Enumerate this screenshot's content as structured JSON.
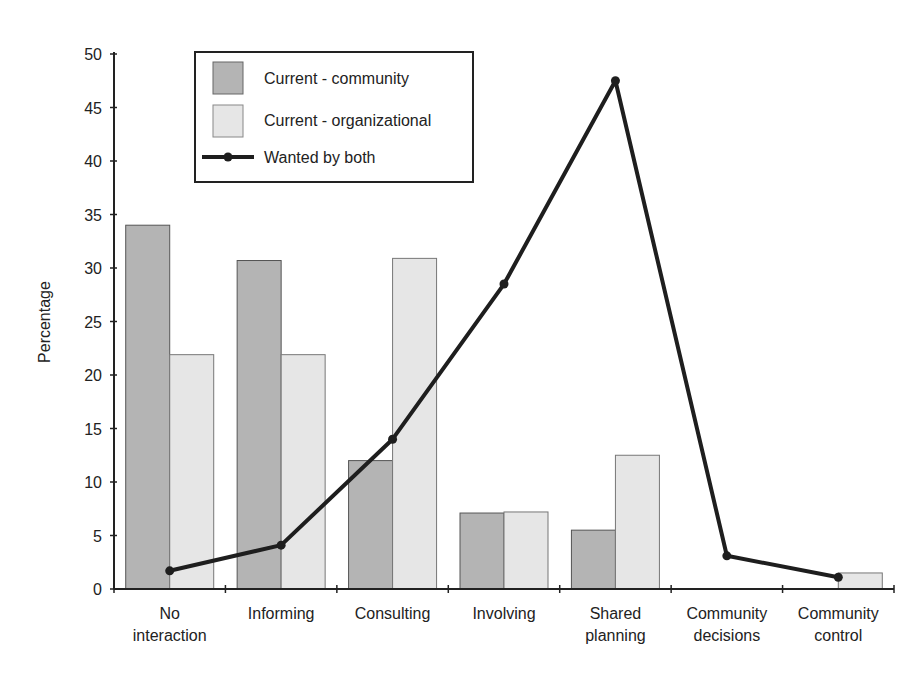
{
  "chart_data": {
    "type": "bar",
    "title": "",
    "xlabel": "",
    "ylabel": "Percentage",
    "ylim": [
      0,
      50
    ],
    "yticks": [
      0,
      5,
      10,
      15,
      20,
      25,
      30,
      35,
      40,
      45,
      50
    ],
    "grid": false,
    "legend_position": "top-left (inside plot)",
    "categories": [
      [
        "No",
        "interaction"
      ],
      [
        "Informing"
      ],
      [
        "Consulting"
      ],
      [
        "Involving"
      ],
      [
        "Shared",
        "planning"
      ],
      [
        "Community",
        "decisions"
      ],
      [
        "Community",
        "control"
      ]
    ],
    "category_names": [
      "No interaction",
      "Informing",
      "Consulting",
      "Involving",
      "Shared planning",
      "Community decisions",
      "Community control"
    ],
    "series": [
      {
        "name": "Current - community",
        "type": "bar",
        "color": "#b4b4b4",
        "values": [
          34,
          30.7,
          12,
          7.1,
          5.5,
          0,
          0
        ]
      },
      {
        "name": "Current - organizational",
        "type": "bar",
        "color": "#e6e6e6",
        "values": [
          21.9,
          21.9,
          30.9,
          7.2,
          12.5,
          0,
          1.5
        ]
      },
      {
        "name": "Wanted by both",
        "type": "line",
        "color": "#1e1e1e",
        "values": [
          1.7,
          4.1,
          14,
          28.5,
          47.5,
          3.1,
          1.1
        ]
      }
    ]
  },
  "legend": {
    "items": [
      {
        "label": "Current - community"
      },
      {
        "label": "Current - organizational"
      },
      {
        "label": "Wanted by both"
      }
    ]
  },
  "colors": {
    "community_bar": "#b4b4b4",
    "organizational_bar": "#e6e6e6",
    "bar_stroke": "#555555",
    "line": "#1e1e1e",
    "axis": "#222222"
  }
}
